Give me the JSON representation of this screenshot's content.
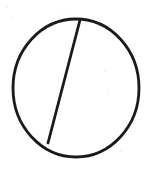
{
  "canvas": {
    "width": 153,
    "height": 170,
    "background_color": "#ffffff",
    "title": "Circle divided by a chord"
  },
  "style": {
    "ink_color": "#1a1a1a",
    "stroke_width": 2.8,
    "speck_color": "#f2f2f2"
  },
  "figure": {
    "circle": {
      "label": "circle-outline",
      "center_x": 76,
      "center_y": 88,
      "radius_x": 63,
      "radius_y": 69,
      "left_edge_x": 13,
      "right_edge_x": 139,
      "top_edge_y": 19,
      "bottom_edge_y": 157
    },
    "chord": {
      "label": "chord-line",
      "start_x": 80,
      "start_y": 20,
      "end_x": 48,
      "end_y": 143,
      "description": "near-vertical chord slanting down to the left"
    },
    "regions": [
      {
        "name": "left-segment",
        "side": "left of chord"
      },
      {
        "name": "right-segment",
        "side": "right of chord"
      }
    ]
  },
  "artifacts": [
    {
      "x": 6,
      "y": 6,
      "size": 2
    },
    {
      "x": 10,
      "y": 16,
      "size": 2
    },
    {
      "x": 63,
      "y": 8,
      "size": 2
    },
    {
      "x": 104,
      "y": 70,
      "size": 2
    },
    {
      "x": 108,
      "y": 90,
      "size": 2
    },
    {
      "x": 120,
      "y": 150,
      "size": 2
    }
  ],
  "chart_data": {
    "type": "diagram",
    "shapes": [
      {
        "kind": "ellipse",
        "name": "circle-outline",
        "cx": 76,
        "cy": 88,
        "rx": 63,
        "ry": 69,
        "stroke": "#1a1a1a",
        "stroke_width": 2.8,
        "fill": "none"
      },
      {
        "kind": "line",
        "name": "chord-line",
        "x1": 80,
        "y1": 20,
        "x2": 48,
        "y2": 143,
        "stroke": "#1a1a1a",
        "stroke_width": 2.8
      }
    ],
    "annotations": [],
    "legend": []
  }
}
